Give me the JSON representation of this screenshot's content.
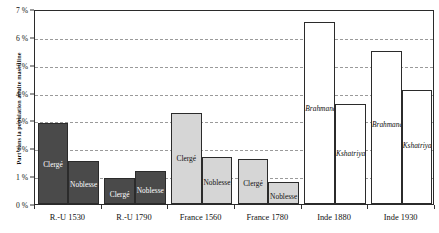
{
  "chart_data": {
    "type": "bar",
    "title": "",
    "subtitle": "",
    "xlabel": "",
    "ylabel": "Part dans la population adulte masculine",
    "ylim": [
      0,
      7
    ],
    "ytick_values": [
      0,
      1,
      2,
      3,
      4,
      5,
      6,
      7
    ],
    "ytick_labels": [
      "0 %",
      "1 %",
      "2 %",
      "3 %",
      "4 %",
      "5 %",
      "6 %",
      "7 %"
    ],
    "grid": "horizontal-dashed",
    "legend": "none",
    "unit": "%",
    "categories": [
      "R.-U 1530",
      "R.-U 1790",
      "France 1560",
      "France 1780",
      "Inde 1880",
      "Inde 1930"
    ],
    "groups": [
      {
        "category": "R.-U 1530",
        "bars": [
          {
            "label": "Clergé",
            "value": 2.9,
            "style": "dark"
          },
          {
            "label": "Noblesse",
            "value": 1.55,
            "style": "dark"
          }
        ]
      },
      {
        "category": "R.-U 1790",
        "bars": [
          {
            "label": "Clergé",
            "value": 0.93,
            "style": "dark"
          },
          {
            "label": "Noblesse",
            "value": 1.18,
            "style": "dark"
          }
        ]
      },
      {
        "category": "France 1560",
        "bars": [
          {
            "label": "Clergé",
            "value": 3.25,
            "style": "light"
          },
          {
            "label": "Noblesse",
            "value": 1.7,
            "style": "light"
          }
        ]
      },
      {
        "category": "France 1780",
        "bars": [
          {
            "label": "Clergé",
            "value": 1.62,
            "style": "light"
          },
          {
            "label": "Noblesse",
            "value": 0.8,
            "style": "light"
          }
        ]
      },
      {
        "category": "Inde 1880",
        "bars": [
          {
            "label": "Brahmanes",
            "value": 6.55,
            "style": "white"
          },
          {
            "label": "Kshatriya",
            "value": 3.6,
            "style": "white"
          }
        ]
      },
      {
        "category": "Inde 1930",
        "bars": [
          {
            "label": "Brahmanes",
            "value": 5.5,
            "style": "white"
          },
          {
            "label": "Kshatriya",
            "value": 4.08,
            "style": "white"
          }
        ]
      }
    ],
    "colors": {
      "dark": "#4a4a4a",
      "light": "#d6d6d6",
      "white": "#ffffff",
      "outline": "#2b2b2b",
      "grid": "#9a9a9a"
    }
  }
}
